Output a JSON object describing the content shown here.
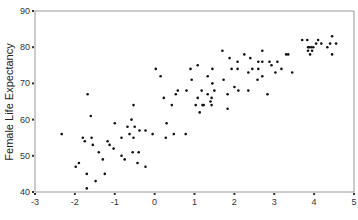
{
  "chart_data": {
    "type": "scatter",
    "title": "",
    "xlabel": "",
    "ylabel": "Female Life Expectancy",
    "xlim": [
      -3,
      5
    ],
    "ylim": [
      40,
      90
    ],
    "x_ticks": [
      -3,
      -2,
      -1,
      0,
      1,
      2,
      3,
      4,
      5
    ],
    "y_ticks": [
      40,
      50,
      60,
      70,
      80,
      90
    ],
    "grid": false,
    "legend": null,
    "marker_color": "#111111",
    "frame_color": "#999999",
    "points": [
      [
        -2.33,
        56
      ],
      [
        -1.98,
        47
      ],
      [
        -1.9,
        48
      ],
      [
        -1.8,
        55
      ],
      [
        -1.75,
        54
      ],
      [
        -1.7,
        45
      ],
      [
        -1.7,
        41
      ],
      [
        -1.68,
        67
      ],
      [
        -1.6,
        61
      ],
      [
        -1.58,
        55
      ],
      [
        -1.55,
        53
      ],
      [
        -1.48,
        43
      ],
      [
        -1.4,
        51
      ],
      [
        -1.3,
        49
      ],
      [
        -1.25,
        45
      ],
      [
        -1.18,
        54
      ],
      [
        -1.13,
        53
      ],
      [
        -1.03,
        52
      ],
      [
        -1.0,
        59
      ],
      [
        -0.83,
        55
      ],
      [
        -0.83,
        50
      ],
      [
        -0.75,
        49
      ],
      [
        -0.68,
        58
      ],
      [
        -0.63,
        56
      ],
      [
        -0.58,
        60
      ],
      [
        -0.55,
        51
      ],
      [
        -0.53,
        64
      ],
      [
        -0.53,
        55
      ],
      [
        -0.5,
        58
      ],
      [
        -0.43,
        48
      ],
      [
        -0.4,
        51
      ],
      [
        -0.38,
        57
      ],
      [
        -0.23,
        57
      ],
      [
        -0.23,
        47
      ],
      [
        -0.05,
        56
      ],
      [
        0.03,
        74
      ],
      [
        0.15,
        72
      ],
      [
        0.23,
        66
      ],
      [
        0.28,
        55
      ],
      [
        0.3,
        59
      ],
      [
        0.43,
        64
      ],
      [
        0.48,
        56
      ],
      [
        0.53,
        67
      ],
      [
        0.58,
        68
      ],
      [
        0.78,
        56
      ],
      [
        0.8,
        68
      ],
      [
        0.9,
        74
      ],
      [
        0.93,
        71
      ],
      [
        1.03,
        64
      ],
      [
        1.08,
        75
      ],
      [
        1.08,
        66
      ],
      [
        1.13,
        62
      ],
      [
        1.18,
        68
      ],
      [
        1.2,
        64
      ],
      [
        1.23,
        64
      ],
      [
        1.33,
        72
      ],
      [
        1.33,
        67
      ],
      [
        1.4,
        65
      ],
      [
        1.43,
        66
      ],
      [
        1.43,
        64
      ],
      [
        1.45,
        74
      ],
      [
        1.45,
        70
      ],
      [
        1.5,
        68
      ],
      [
        1.7,
        79
      ],
      [
        1.73,
        71
      ],
      [
        1.83,
        67
      ],
      [
        1.83,
        63
      ],
      [
        1.88,
        77
      ],
      [
        1.93,
        74
      ],
      [
        2.0,
        69
      ],
      [
        2.08,
        76
      ],
      [
        2.08,
        74
      ],
      [
        2.1,
        68
      ],
      [
        2.25,
        78
      ],
      [
        2.35,
        73
      ],
      [
        2.35,
        68
      ],
      [
        2.4,
        77
      ],
      [
        2.45,
        74
      ],
      [
        2.58,
        71
      ],
      [
        2.6,
        76
      ],
      [
        2.6,
        74
      ],
      [
        2.7,
        79
      ],
      [
        2.7,
        76
      ],
      [
        2.7,
        72
      ],
      [
        2.83,
        67
      ],
      [
        2.88,
        76
      ],
      [
        2.93,
        75
      ],
      [
        3.03,
        73
      ],
      [
        3.08,
        76
      ],
      [
        3.18,
        74
      ],
      [
        3.3,
        78
      ],
      [
        3.35,
        78
      ],
      [
        3.45,
        73
      ],
      [
        3.7,
        82
      ],
      [
        3.83,
        82
      ],
      [
        3.85,
        80
      ],
      [
        3.85,
        79
      ],
      [
        3.88,
        80
      ],
      [
        3.9,
        78
      ],
      [
        3.93,
        80
      ],
      [
        3.95,
        79
      ],
      [
        3.98,
        80
      ],
      [
        4.05,
        81
      ],
      [
        4.1,
        82
      ],
      [
        4.18,
        81
      ],
      [
        4.33,
        80
      ],
      [
        4.4,
        81
      ],
      [
        4.45,
        83
      ],
      [
        4.45,
        78
      ],
      [
        4.55,
        81
      ]
    ]
  }
}
